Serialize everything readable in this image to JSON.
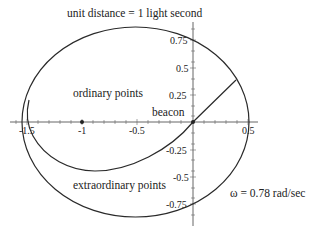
{
  "title": "unit distance = 1 light second",
  "labels": {
    "ordinary": "ordinary points",
    "beacon": "beacon",
    "extraordinary": "extraordinary points",
    "omega": "ω = 0.78 rad/sec"
  },
  "axes": {
    "x_ticks": [
      "-1.5",
      "-1",
      "-0.5",
      "0.5"
    ],
    "y_ticks_pos": [
      "0.75",
      "0.5",
      "0.25"
    ],
    "y_ticks_neg": [
      "-0.25",
      "-0.5",
      "-0.75"
    ],
    "x_range": [
      -1.65,
      0.6
    ],
    "y_range": [
      -0.95,
      0.85
    ]
  },
  "points": [
    {
      "name": "beacon-origin",
      "x": 0,
      "y": 0
    },
    {
      "name": "center-point",
      "x": -1,
      "y": 0
    }
  ],
  "shapes": {
    "outer_ellipse": {
      "cx": -0.52,
      "cy": 0,
      "rx": 1.03,
      "ry": 0.87
    },
    "boundary_curve": "spiral-like curve from (-1.5, 0.2) down through (-0.9, -0.45) to origin and straight to (0.39, 0.38)"
  },
  "colors": {
    "stroke": "#2a2a2a",
    "axis": "#555555",
    "background": "#ffffff"
  }
}
